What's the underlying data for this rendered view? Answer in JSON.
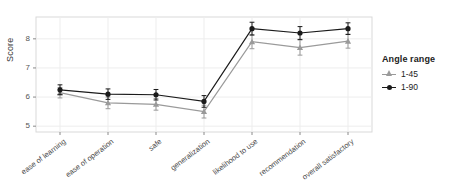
{
  "chart_data": {
    "type": "line",
    "title": "",
    "xlabel": "",
    "ylabel": "Score",
    "ylim": [
      4.8,
      8.75
    ],
    "yticks": [
      5,
      6,
      7,
      8
    ],
    "grid": true,
    "legend_position": "right",
    "legend_title": "Angle range",
    "categories": [
      "ease of learning",
      "ease of operation",
      "safe",
      "generalization",
      "likelihood to use",
      "recommendation",
      "overall satisfactory"
    ],
    "series": [
      {
        "name": "1-45",
        "color": "#9a9a9a",
        "marker": "triangle",
        "values": [
          6.15,
          5.8,
          5.75,
          5.5,
          7.9,
          7.7,
          7.92
        ],
        "errors": [
          0.18,
          0.2,
          0.2,
          0.22,
          0.24,
          0.26,
          0.24
        ]
      },
      {
        "name": "1-90",
        "color": "#1a1a1a",
        "marker": "circle",
        "values": [
          6.25,
          6.1,
          6.08,
          5.85,
          8.35,
          8.2,
          8.35
        ],
        "errors": [
          0.17,
          0.18,
          0.18,
          0.2,
          0.22,
          0.22,
          0.2
        ]
      }
    ]
  },
  "axis": {
    "y_title": "Score",
    "y_tick_labels": [
      "8",
      "7",
      "6",
      "5"
    ],
    "x_tick_labels": [
      "ease of learning",
      "ease of operation",
      "safe",
      "generalization",
      "likelihood to use",
      "recommendation",
      "overall satisfactory"
    ]
  },
  "legend": {
    "title": "Angle range",
    "entries": [
      {
        "label": "1-45",
        "color": "#9a9a9a",
        "marker": "triangle-icon"
      },
      {
        "label": "1-90",
        "color": "#1a1a1a",
        "marker": "circle-icon"
      }
    ]
  },
  "colors": {
    "panel_border": "#d9d9d9",
    "gridline": "#ededed",
    "series_light": "#9a9a9a",
    "series_dark": "#1a1a1a",
    "text": "#3a3a3a"
  }
}
